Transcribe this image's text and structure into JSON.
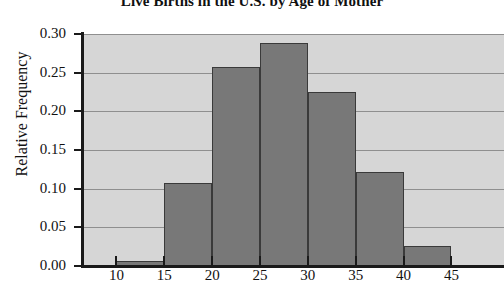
{
  "chart_data": {
    "type": "bar",
    "title": "Live Births in the U.S. by Age of Mother",
    "xlabel": "",
    "ylabel": "Relative Frequency",
    "categories": [
      "10-15",
      "15-20",
      "20-25",
      "25-30",
      "30-35",
      "35-40",
      "40-45"
    ],
    "bin_edges": [
      10,
      15,
      20,
      25,
      30,
      35,
      40,
      45
    ],
    "values": [
      0.007,
      0.107,
      0.257,
      0.288,
      0.225,
      0.121,
      0.026
    ],
    "xlim": [
      6.5,
      50.5
    ],
    "ylim": [
      0.0,
      0.3
    ],
    "xticks": [
      10,
      15,
      20,
      25,
      30,
      35,
      40,
      45
    ],
    "xtick_labels": [
      "10",
      "15",
      "20",
      "25",
      "30",
      "35",
      "40",
      "45"
    ],
    "yticks": [
      0.0,
      0.05,
      0.1,
      0.15,
      0.2,
      0.25,
      0.3
    ],
    "ytick_labels": [
      "0.00",
      "0.05",
      "0.10",
      "0.15",
      "0.20",
      "0.25",
      "0.30"
    ],
    "grid": true,
    "grid_axis": "y",
    "legend": false,
    "bar_color": "#787878",
    "bar_edge_color": "#3a3a3a",
    "plot_background": "#d6d6d6",
    "figure_background": "#ffffff",
    "gridline_color": "#8f8f8f",
    "axis_color": "#1a1a1a"
  }
}
